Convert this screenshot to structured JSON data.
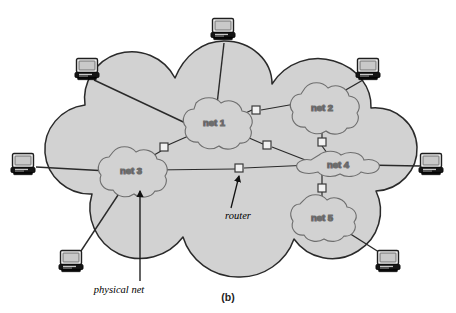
{
  "figure": {
    "caption": "(b)",
    "background_color": "#ffffff",
    "internet_cloud": {
      "fill_color": "#d2d2d2",
      "stroke_color": "#2a2a2a"
    },
    "physical_net_cloud": {
      "fill_color": "#d2d2d2",
      "stroke_color": "#6e6e6e"
    },
    "router": {
      "fill_color": "#f2f2f2",
      "stroke_color": "#3a3a3a",
      "icon": "router-square-icon"
    },
    "link": {
      "stroke_color": "#2a2a2a"
    },
    "host": {
      "icon": "computer-monitor-icon",
      "screen_color": "#ededed",
      "body_color": "#1a1a1a",
      "stroke_color": "#1f1f1f"
    }
  },
  "networks": [
    {
      "id": "net1",
      "label": "net 1",
      "cx": 214,
      "cy": 122
    },
    {
      "id": "net2",
      "label": "net 2",
      "cx": 322,
      "cy": 107
    },
    {
      "id": "net3",
      "label": "net 3",
      "cx": 130,
      "cy": 170
    },
    {
      "id": "net4",
      "label": "net 4",
      "cx": 337,
      "cy": 165
    },
    {
      "id": "net5",
      "label": "net 5",
      "cx": 321,
      "cy": 217
    }
  ],
  "routers": [
    {
      "id": "r1",
      "x": 256,
      "y": 110,
      "between": [
        "net 1",
        "net 2"
      ]
    },
    {
      "id": "r2",
      "x": 267,
      "y": 145,
      "between": [
        "net 1",
        "net 4"
      ]
    },
    {
      "id": "r3",
      "x": 164,
      "y": 147,
      "between": [
        "net 1",
        "net 3"
      ]
    },
    {
      "id": "r4",
      "x": 239,
      "y": 168,
      "between": [
        "net 3",
        "net 4"
      ]
    },
    {
      "id": "r5",
      "x": 322,
      "y": 142,
      "between": [
        "net 2",
        "net 4"
      ]
    },
    {
      "id": "r6",
      "x": 322,
      "y": 188,
      "between": [
        "net 4",
        "net 5"
      ]
    }
  ],
  "hosts": [
    {
      "id": "h-top",
      "x": 224,
      "y": 30,
      "attaches_to": "net 1"
    },
    {
      "id": "h-top-left",
      "x": 88,
      "y": 72,
      "attaches_to": "net 1"
    },
    {
      "id": "h-top-right",
      "x": 369,
      "y": 72,
      "attaches_to": "net 2"
    },
    {
      "id": "h-left",
      "x": 24,
      "y": 163,
      "attaches_to": "net 3"
    },
    {
      "id": "h-right",
      "x": 432,
      "y": 165,
      "attaches_to": "net 4"
    },
    {
      "id": "h-bottom-left",
      "x": 72,
      "y": 262,
      "attaches_to": "net 3"
    },
    {
      "id": "h-bottom-right",
      "x": 389,
      "y": 262,
      "attaches_to": "net 5"
    }
  ],
  "annotations": [
    {
      "id": "router-annotation",
      "label": "router",
      "label_x": 238,
      "label_y": 216,
      "arrow_from_x": 231,
      "arrow_from_y": 208,
      "arrow_to_x": 239,
      "arrow_to_y": 176
    },
    {
      "id": "physical-net-annotation",
      "label": "physical net",
      "label_x": 119,
      "label_y": 290,
      "arrow_from_x": 140,
      "arrow_from_y": 281,
      "arrow_to_x": 140,
      "arrow_to_y": 191
    }
  ]
}
